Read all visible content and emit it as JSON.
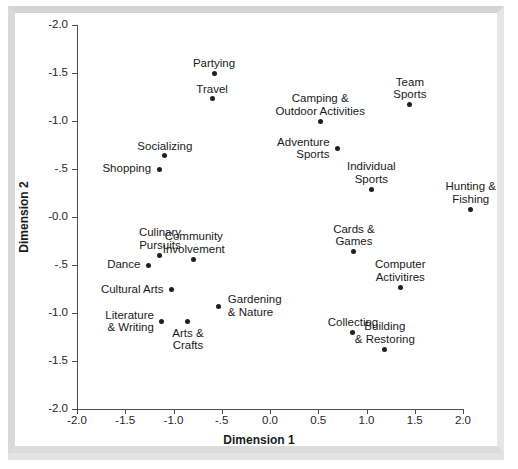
{
  "figure": {
    "x_axis_title": "Dimension 1",
    "y_axis_title": "Dimension 2",
    "point_color": "#1f1f1f",
    "axis_color": "#4d4d4d",
    "frame_color": "#d9d9d9",
    "background": "#ffffff"
  },
  "chart_data": {
    "type": "scatter",
    "title": "",
    "xlabel": "Dimension 1",
    "ylabel": "Dimension 2",
    "xlim": [
      -2.0,
      2.0
    ],
    "ylim": [
      -2.0,
      2.0
    ],
    "grid": false,
    "legend": "none",
    "x_ticks": [
      "-2.0",
      "-1.5",
      "-1.0",
      "-.5",
      "0.0",
      "0.5",
      "1.0",
      "1.5",
      "2.0"
    ],
    "x_tick_values": [
      -2.0,
      -1.5,
      -1.0,
      -0.5,
      0.0,
      0.5,
      1.0,
      1.5,
      2.0
    ],
    "y_ticks": [
      "-2.0",
      "-1.5",
      "-1.0",
      "-.5",
      "-0.0",
      "-.5",
      "-1.0",
      "-1.5",
      "-2.0"
    ],
    "y_tick_values": [
      -2.0,
      -1.5,
      -1.0,
      -0.5,
      0.0,
      0.5,
      1.0,
      1.5,
      2.0
    ],
    "y_axis_inverted": true,
    "points": [
      {
        "label": "Partying",
        "x": -0.58,
        "y": -1.5
      },
      {
        "label": "Travel",
        "x": -0.6,
        "y": -1.23
      },
      {
        "label": "Socializing",
        "x": -1.09,
        "y": -0.64
      },
      {
        "label": "Shopping",
        "x": -1.15,
        "y": -0.5
      },
      {
        "label": "Camping &\nOutdoor Activities",
        "x": 0.52,
        "y": -1.0
      },
      {
        "label": "Team\nSports",
        "x": 1.45,
        "y": -1.17
      },
      {
        "label": "Adventure\nSports",
        "x": 0.7,
        "y": -0.71
      },
      {
        "label": "Individual\nSports",
        "x": 1.05,
        "y": -0.29
      },
      {
        "label": "Hunting &\nFishing",
        "x": 2.08,
        "y": -0.08
      },
      {
        "label": "Culinary\nPursuits",
        "x": -1.14,
        "y": 0.4
      },
      {
        "label": "Community\nInvolvement",
        "x": -0.79,
        "y": 0.44
      },
      {
        "label": "Dance",
        "x": -1.26,
        "y": 0.5
      },
      {
        "label": "Cards &\nGames",
        "x": 0.87,
        "y": 0.36
      },
      {
        "label": "Computer\nActivitires",
        "x": 1.35,
        "y": 0.73
      },
      {
        "label": "Cultural Arts",
        "x": -1.02,
        "y": 0.76
      },
      {
        "label": "Gardening\n& Nature",
        "x": -0.53,
        "y": 0.93
      },
      {
        "label": "Literature\n& Writing",
        "x": -1.12,
        "y": 1.09
      },
      {
        "label": "Arts &\nCrafts",
        "x": -0.85,
        "y": 1.09
      },
      {
        "label": "Collecting",
        "x": 0.86,
        "y": 1.2
      },
      {
        "label": "Building\n& Restoring",
        "x": 1.19,
        "y": 1.38
      }
    ]
  },
  "labels": {
    "partying": "Partying",
    "travel": "Travel",
    "socializing": "Socializing",
    "shopping": "Shopping",
    "camping": "Camping &\nOutdoor Activities",
    "team_sports": "Team\nSports",
    "adventure_sports": "Adventure\nSports",
    "individual_sports": "Individual\nSports",
    "hunting_fishing": "Hunting &\nFishing",
    "culinary_pursuits": "Culinary\nPursuits",
    "community_involvement": "Community\nInvolvement",
    "dance": "Dance",
    "cards_games": "Cards &\nGames",
    "computer_activities": "Computer\nActivitires",
    "cultural_arts": "Cultural Arts",
    "gardening_nature": "Gardening\n& Nature",
    "literature_writing": "Literature\n& Writing",
    "arts_crafts": "Arts &\nCrafts",
    "collecting": "Collecting",
    "building_restoring": "Building\n& Restoring"
  }
}
